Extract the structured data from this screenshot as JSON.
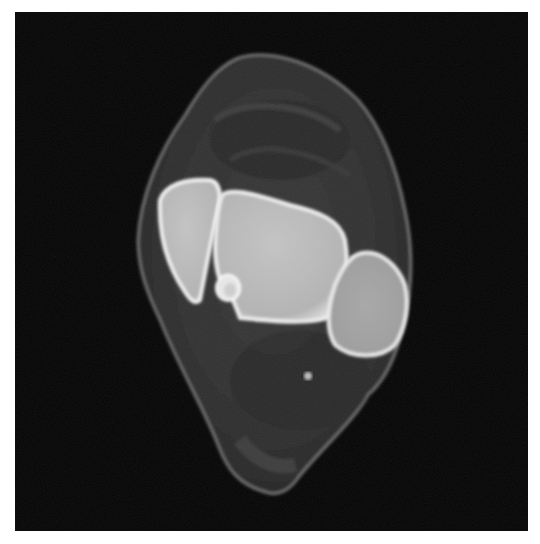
{
  "image": {
    "subject": "axial cross-sectional medical scan of ankle/lower leg",
    "background_color": "#050505",
    "frame_color": "#ffffff",
    "structures": [
      {
        "name": "soft-tissue-outline",
        "tone": "#4a4a4a"
      },
      {
        "name": "bone-left",
        "tone": "#d8d8d8"
      },
      {
        "name": "bone-center",
        "tone": "#cfcfcf"
      },
      {
        "name": "bone-right",
        "tone": "#c8c8c8"
      },
      {
        "name": "tendon-small-round",
        "tone": "#e6e6e6"
      }
    ]
  }
}
